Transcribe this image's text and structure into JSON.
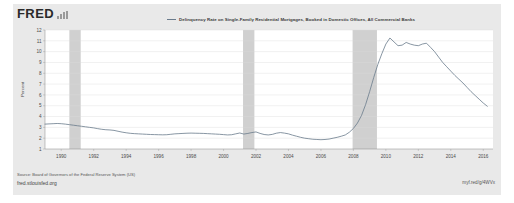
{
  "brand": {
    "logo_text": "FRED",
    "logo_icon": "bar-chart-icon"
  },
  "legend": {
    "series_label": "Delinquency Rate on Single-Family Residential Mortgages, Booked in Domestic Offices, All Commercial Banks",
    "line_color": "#6a7b8c"
  },
  "footer": {
    "source": "Source: Board of Governors of the Federal Reserve System (US)",
    "site_url": "fred.stlouisfed.org",
    "short_url": "myf.red/g/4WVx"
  },
  "chart_data": {
    "type": "line",
    "title": "Delinquency Rate on Single-Family Residential Mortgages, Booked in Domestic Offices, All Commercial Banks",
    "xlabel": "",
    "ylabel": "Percent",
    "ylim": [
      1,
      12
    ],
    "xlim": [
      1989.0,
      2016.6
    ],
    "grid": true,
    "legend_position": "top-center",
    "yticks": [
      1,
      2,
      3,
      4,
      5,
      6,
      7,
      8,
      9,
      10,
      11,
      12
    ],
    "xticks": [
      1990,
      1992,
      1994,
      1996,
      1998,
      2000,
      2002,
      2004,
      2006,
      2008,
      2010,
      2012,
      2014,
      2016
    ],
    "series": [
      {
        "name": "Delinquency Rate on Single-Family Residential Mortgages, Booked in Domestic Offices, All Commercial Banks",
        "color": "#6a7b8c",
        "x": [
          1989.0,
          1989.25,
          1989.5,
          1989.75,
          1990.0,
          1990.25,
          1990.5,
          1990.75,
          1991.0,
          1991.25,
          1991.5,
          1991.75,
          1992.0,
          1992.25,
          1992.5,
          1992.75,
          1993.0,
          1993.25,
          1993.5,
          1993.75,
          1994.0,
          1994.25,
          1994.5,
          1994.75,
          1995.0,
          1995.25,
          1995.5,
          1995.75,
          1996.0,
          1996.25,
          1996.5,
          1996.75,
          1997.0,
          1997.25,
          1997.5,
          1997.75,
          1998.0,
          1998.25,
          1998.5,
          1998.75,
          1999.0,
          1999.25,
          1999.5,
          1999.75,
          2000.0,
          2000.25,
          2000.5,
          2000.75,
          2001.0,
          2001.25,
          2001.5,
          2001.75,
          2002.0,
          2002.25,
          2002.5,
          2002.75,
          2003.0,
          2003.25,
          2003.5,
          2003.75,
          2004.0,
          2004.25,
          2004.5,
          2004.75,
          2005.0,
          2005.25,
          2005.5,
          2005.75,
          2006.0,
          2006.25,
          2006.5,
          2006.75,
          2007.0,
          2007.25,
          2007.5,
          2007.75,
          2008.0,
          2008.25,
          2008.5,
          2008.75,
          2009.0,
          2009.25,
          2009.5,
          2009.75,
          2010.0,
          2010.25,
          2010.5,
          2010.75,
          2011.0,
          2011.25,
          2011.5,
          2011.75,
          2012.0,
          2012.25,
          2012.5,
          2012.75,
          2013.0,
          2013.25,
          2013.5,
          2013.75,
          2014.0,
          2014.25,
          2014.5,
          2014.75,
          2015.0,
          2015.25,
          2015.5,
          2015.75,
          2016.0,
          2016.25
        ],
        "y": [
          3.3,
          3.32,
          3.34,
          3.36,
          3.34,
          3.3,
          3.25,
          3.2,
          3.15,
          3.1,
          3.05,
          3.0,
          2.95,
          2.88,
          2.82,
          2.78,
          2.76,
          2.72,
          2.64,
          2.56,
          2.5,
          2.45,
          2.42,
          2.4,
          2.38,
          2.36,
          2.34,
          2.33,
          2.32,
          2.31,
          2.32,
          2.36,
          2.4,
          2.42,
          2.44,
          2.46,
          2.47,
          2.46,
          2.45,
          2.44,
          2.42,
          2.4,
          2.38,
          2.36,
          2.33,
          2.3,
          2.32,
          2.4,
          2.48,
          2.38,
          2.44,
          2.52,
          2.58,
          2.44,
          2.34,
          2.3,
          2.35,
          2.46,
          2.52,
          2.47,
          2.4,
          2.28,
          2.18,
          2.08,
          2.0,
          1.95,
          1.9,
          1.88,
          1.86,
          1.88,
          1.92,
          2.0,
          2.08,
          2.18,
          2.3,
          2.55,
          2.9,
          3.4,
          4.1,
          5.1,
          6.3,
          7.6,
          8.8,
          9.8,
          10.7,
          11.26,
          10.9,
          10.55,
          10.6,
          10.85,
          10.7,
          10.6,
          10.55,
          10.7,
          10.78,
          10.4,
          10.0,
          9.5,
          9.0,
          8.6,
          8.2,
          7.8,
          7.45,
          7.1,
          6.7,
          6.3,
          5.95,
          5.6,
          5.25,
          4.95
        ]
      }
    ],
    "recession_bands": [
      {
        "start": 1990.5,
        "end": 1991.2
      },
      {
        "start": 2001.2,
        "end": 2001.9
      },
      {
        "start": 2007.95,
        "end": 2009.45
      }
    ]
  }
}
